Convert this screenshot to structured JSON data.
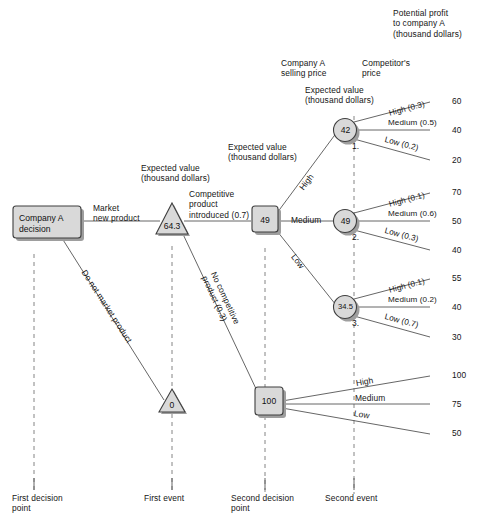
{
  "diagram": {
    "title_note": "Potential profit\nto company A\n(thousand dollars)",
    "column_headers": {
      "company_a_price": "Company A\nselling price",
      "competitors_price": "Competitor's\nprice",
      "expected_value_right": "Expected value\n(thousand dollars)",
      "expected_value_left": "Expected value\n(thousand dollars)"
    },
    "nodes": {
      "root": {
        "label": "Company A\ndecision",
        "shape": "rect"
      },
      "first_event": {
        "label": "64.3",
        "shape": "triangle"
      },
      "no_market": {
        "label": "0",
        "shape": "triangle"
      },
      "second_decision": {
        "label": "49",
        "shape": "rect"
      },
      "no_competition": {
        "label": "100",
        "shape": "rect"
      },
      "event1": {
        "label": "42",
        "shape": "circle",
        "index": "1."
      },
      "event2": {
        "label": "49",
        "shape": "circle",
        "index": "2."
      },
      "event3": {
        "label": "34.5",
        "shape": "circle",
        "index": "3."
      }
    },
    "edges": {
      "market_new_product": "Market\nnew product",
      "do_not_market": "Do not market product",
      "competitive_product": "Competitive\nproduct\nintroduced (0.7)",
      "no_competitive_product": "No competitive\nproduct (0.3)",
      "price_high": "High",
      "price_medium": "Medium",
      "price_low": "Low"
    },
    "branches": [
      {
        "node": "42",
        "index": "1.",
        "outcomes": [
          {
            "label": "High (0.3)",
            "payoff": "60"
          },
          {
            "label": "Medium (0.5)",
            "payoff": "40"
          },
          {
            "label": "Low (0.2)",
            "payoff": "20"
          }
        ]
      },
      {
        "node": "49",
        "index": "2.",
        "outcomes": [
          {
            "label": "High (0.1)",
            "payoff": "70"
          },
          {
            "label": "Medium (0.6)",
            "payoff": "50"
          },
          {
            "label": "Low (0.3)",
            "payoff": "40"
          }
        ]
      },
      {
        "node": "34.5",
        "index": "3.",
        "outcomes": [
          {
            "label": "High (0.1)",
            "payoff": "55"
          },
          {
            "label": "Medium (0.2)",
            "payoff": "40"
          },
          {
            "label": "Low (0.7)",
            "payoff": "30"
          }
        ]
      },
      {
        "node": "100",
        "index": "",
        "outcomes": [
          {
            "label": "High",
            "payoff": "100"
          },
          {
            "label": "Medium",
            "payoff": "75"
          },
          {
            "label": "Low",
            "payoff": "50"
          }
        ]
      }
    ],
    "axis_labels": [
      "First decision\npoint",
      "First event",
      "Second decision\npoint",
      "Second event"
    ],
    "colors": {
      "line": "#4d4d4d",
      "node_fill": "#d9d9d9",
      "node_stroke": "#4a4a4a",
      "shadow": "#9a9a9a",
      "text": "#151515"
    }
  }
}
